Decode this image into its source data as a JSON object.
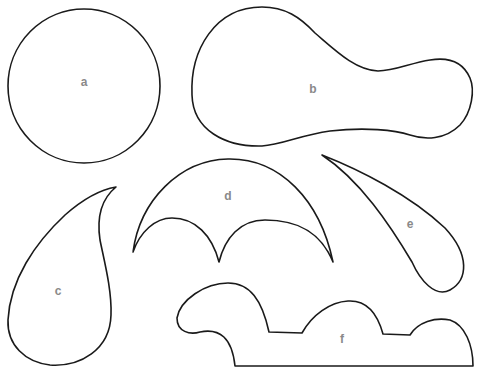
{
  "diagram": {
    "background": "#ffffff",
    "stroke_color": "#1a1a1a",
    "label_color": "#8a8a8a",
    "shapes": [
      {
        "id": "a",
        "label": "a",
        "description": "circle"
      },
      {
        "id": "b",
        "label": "b",
        "description": "bulbous pear / gourd shape"
      },
      {
        "id": "c",
        "label": "c",
        "description": "teardrop / paisley with hooked tip"
      },
      {
        "id": "d",
        "label": "d",
        "description": "large arc with two scalloped inner arcs"
      },
      {
        "id": "e",
        "label": "e",
        "description": "elongated curved teardrop"
      },
      {
        "id": "f",
        "label": "f",
        "description": "wavy-top profile with flat bottom"
      }
    ]
  }
}
